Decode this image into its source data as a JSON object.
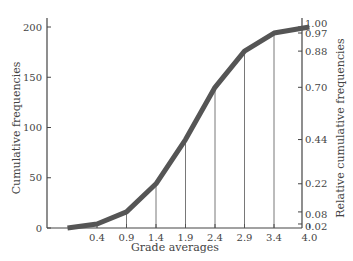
{
  "chart_data": {
    "type": "line",
    "title": "",
    "xlabel": "Grade averages",
    "ylabel": "Cumulative frequencies",
    "y2label": "Relative cumulative frequencies",
    "x_tick_labels": [
      "0.4",
      "0.9",
      "1.4",
      "1.9",
      "2.4",
      "2.9",
      "3.4",
      "4.0"
    ],
    "y_tick_labels": [
      "0",
      "50",
      "100",
      "150",
      "200"
    ],
    "y2_tick_labels": [
      "0.02",
      "0.08",
      "0.22",
      "0.44",
      "0.70",
      "0.88",
      "0.97",
      "1.00"
    ],
    "ylim": [
      0,
      200
    ],
    "y2lim": [
      0,
      1.0
    ],
    "grid": false,
    "legend": null,
    "series": [
      {
        "name": "Cumulative frequency",
        "x": [
          -0.1,
          0.4,
          0.9,
          1.4,
          1.9,
          2.4,
          2.9,
          3.4,
          4.0
        ],
        "values": [
          0,
          4,
          16,
          44,
          88,
          140,
          176,
          194,
          200
        ],
        "relative": [
          0,
          0.02,
          0.08,
          0.22,
          0.44,
          0.7,
          0.88,
          0.97,
          1.0
        ]
      }
    ],
    "line_color": "#555555"
  }
}
